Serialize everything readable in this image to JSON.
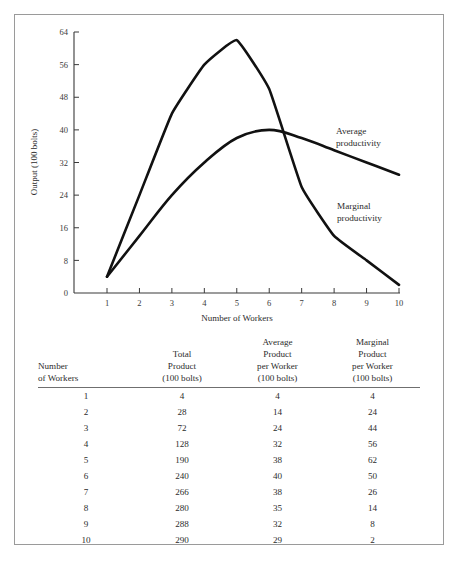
{
  "chart_data": {
    "type": "line",
    "title": "",
    "xlabel": "Number of Workers",
    "ylabel": "Output (100 bolts)",
    "x": [
      1,
      2,
      3,
      4,
      5,
      6,
      7,
      8,
      9,
      10
    ],
    "xlim": [
      0.45,
      10.3
    ],
    "ylim": [
      0,
      64
    ],
    "yticks": [
      0,
      8,
      16,
      24,
      32,
      40,
      48,
      56,
      64
    ],
    "xticks": [
      1,
      2,
      3,
      4,
      5,
      6,
      7,
      8,
      9,
      10
    ],
    "grid": false,
    "legend_position": "inline-annotation",
    "series": [
      {
        "name": "Marginal productivity",
        "label": "Marginal",
        "label_line2": "productivity",
        "values": [
          4,
          24,
          44,
          56,
          62,
          50,
          26,
          14,
          8,
          2
        ]
      },
      {
        "name": "Average productivity",
        "label": "Average",
        "label_line2": "productivity",
        "values": [
          4,
          14,
          24,
          32,
          38,
          40,
          38,
          35,
          32,
          29
        ]
      }
    ],
    "annotations": [
      {
        "text": "Average productivity",
        "x": 8.2,
        "y": 37
      },
      {
        "text": "Marginal productivity",
        "x": 7.4,
        "y": 21
      }
    ]
  },
  "table": {
    "headers": [
      {
        "lines": [
          "Number",
          "of Workers"
        ]
      },
      {
        "lines": [
          "Total",
          "Product",
          "(100 bolts)"
        ]
      },
      {
        "lines": [
          "Average",
          "Product",
          "per Worker",
          "(100 bolts)"
        ]
      },
      {
        "lines": [
          "Marginal",
          "Product",
          "per Worker",
          "(100 bolts)"
        ]
      }
    ],
    "rows": [
      {
        "workers": "1",
        "total": "4",
        "average": "4",
        "marginal": "4"
      },
      {
        "workers": "2",
        "total": "28",
        "average": "14",
        "marginal": "24"
      },
      {
        "workers": "3",
        "total": "72",
        "average": "24",
        "marginal": "44"
      },
      {
        "workers": "4",
        "total": "128",
        "average": "32",
        "marginal": "56"
      },
      {
        "workers": "5",
        "total": "190",
        "average": "38",
        "marginal": "62"
      },
      {
        "workers": "6",
        "total": "240",
        "average": "40",
        "marginal": "50"
      },
      {
        "workers": "7",
        "total": "266",
        "average": "38",
        "marginal": "26"
      },
      {
        "workers": "8",
        "total": "280",
        "average": "35",
        "marginal": "14"
      },
      {
        "workers": "9",
        "total": "288",
        "average": "32",
        "marginal": "8"
      },
      {
        "workers": "10",
        "total": "290",
        "average": "29",
        "marginal": "2"
      }
    ]
  },
  "colors": {
    "curve": "#111111",
    "axis": "#3a3a3a",
    "frame": "#9a9a9a",
    "text": "#2b2b2b"
  }
}
